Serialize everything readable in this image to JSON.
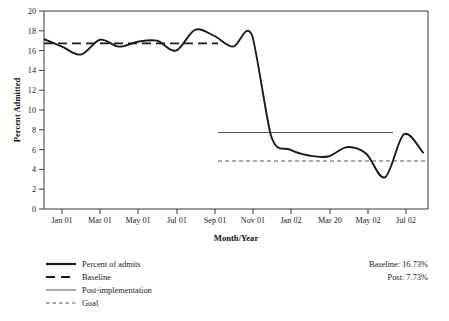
{
  "chart_data": {
    "type": "line",
    "title": "",
    "xlabel": "Month/Year",
    "ylabel": "Percent Admitted",
    "ylim": [
      0,
      20
    ],
    "ytick_labels": [
      "0",
      "2",
      "4",
      "6",
      "8",
      "10",
      "12",
      "14",
      "16",
      "18",
      "20"
    ],
    "ytick_values": [
      0,
      2,
      4,
      6,
      8,
      10,
      12,
      14,
      16,
      18,
      20
    ],
    "xtick_labels": [
      "Jan 01",
      "Mar 01",
      "May 01",
      "Jul 01",
      "Sep 01",
      "Nov 01",
      "Jan 02",
      "Mar 20",
      "May 02",
      "Jul 02"
    ],
    "grid": false,
    "legend_position": "below-left",
    "x_months": [
      "Dec 00",
      "Jan 01",
      "Feb 01",
      "Mar 01",
      "Apr 01",
      "May 01",
      "Jun 01",
      "Jul 01",
      "Aug 01",
      "Sep 01",
      "Oct 01",
      "Nov 01",
      "Dec 01",
      "Jan 02",
      "Feb 02",
      "Mar 02",
      "Apr 02",
      "May 02",
      "Jun 02",
      "Jul 02",
      "Aug 02"
    ],
    "series": [
      {
        "name": "Percent of admits",
        "style": "solid-thick",
        "color": "#1a1a1a",
        "values": [
          17.2,
          16.4,
          15.6,
          17.1,
          16.4,
          16.9,
          17.0,
          16.0,
          18.1,
          17.5,
          16.4,
          17.55,
          7.4,
          6.0,
          5.4,
          5.3,
          6.25,
          5.6,
          3.2,
          7.55,
          5.7
        ]
      }
    ],
    "reference_lines": [
      {
        "name": "Baseline",
        "value": 16.73,
        "style": "dashed-thick",
        "color": "#1a1a1a",
        "span": "pre-implementation"
      },
      {
        "name": "Post-implementation",
        "value": 7.73,
        "style": "solid-thin",
        "color": "#555555",
        "span": "post-implementation"
      },
      {
        "name": "Goal",
        "value": 4.85,
        "style": "dotted-thin",
        "color": "#555555",
        "span": "post-implementation"
      }
    ],
    "annotations": [
      {
        "text": "Baseline: 16.73%"
      },
      {
        "text": "Post: 7.73%"
      }
    ]
  },
  "axes": {
    "y_title": "Percent Admitted",
    "x_title": "Month/Year"
  },
  "legend": {
    "items": [
      {
        "label": "Percent of admits",
        "swatch": "solid-thick-line-icon"
      },
      {
        "label": "Baseline",
        "swatch": "dashed-thick-line-icon"
      },
      {
        "label": "Post-implementation",
        "swatch": "solid-thin-line-icon"
      },
      {
        "label": "Goal",
        "swatch": "dotted-thin-line-icon"
      }
    ]
  },
  "annotations": {
    "baseline_text": "Baseline: 16.73%",
    "post_text": "Post: 7.73%"
  },
  "ticks": {
    "y": [
      "20",
      "18",
      "16",
      "14",
      "12",
      "10",
      "8",
      "6",
      "4",
      "2",
      "0"
    ],
    "x": [
      "Jan 01",
      "Mar 01",
      "May 01",
      "Jul 01",
      "Sep 01",
      "Nov 01",
      "Jan 02",
      "Mar 20",
      "May 02",
      "Jul 02"
    ]
  },
  "colors": {
    "series": "#1a1a1a",
    "reference_gray": "#555555",
    "axis": "#3a3a3a",
    "background": "#ffffff"
  }
}
